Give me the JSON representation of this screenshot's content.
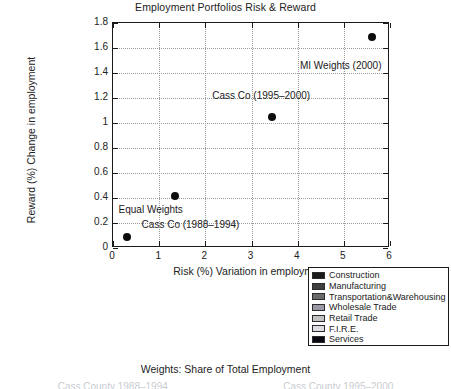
{
  "chart_data": {
    "type": "scatter",
    "title": "Employment Portfolios Risk & Reward",
    "xlabel": "Risk (%) Variation in employment",
    "ylabel": "Reward (%) Change in employment",
    "xlim": [
      0,
      6
    ],
    "ylim": [
      0,
      1.8
    ],
    "xticks": [
      "0",
      "1",
      "2",
      "3",
      "4",
      "5",
      "6"
    ],
    "yticks": [
      "0",
      "0.2",
      "0.4",
      "0.6",
      "0.8",
      "1",
      "1.2",
      "1.4",
      "1.6",
      "1.8"
    ],
    "grid": true,
    "legend_position": "below-right",
    "marker": "filled-circle",
    "marker_color": "#0d0d0d",
    "points": [
      {
        "label": "Equal Weights",
        "x": 0.3,
        "y": 0.09
      },
      {
        "label": "Cass Co (1988-1994)",
        "x": 1.35,
        "y": 0.42
      },
      {
        "label": "Cass Co (1995-2000)",
        "x": 3.45,
        "y": 1.05
      },
      {
        "label": "MI Weights (2000)",
        "x": 5.6,
        "y": 1.69
      }
    ],
    "annotations": [
      {
        "text": "MI Weights (2000)",
        "x": 4.05,
        "y": 1.46
      },
      {
        "text": "Cass Co (1995–2000)",
        "x": 2.15,
        "y": 1.22
      },
      {
        "text": "Equal Weights",
        "x": 0.12,
        "y": 0.305
      },
      {
        "text": "Cass Co (1988–1994)",
        "x": 0.62,
        "y": 0.185
      }
    ],
    "legend": {
      "entries": [
        {
          "label": "Construction",
          "color": "#1b1b1b"
        },
        {
          "label": "Manufacturing",
          "color": "#3f3f3f"
        },
        {
          "label": "Transportation&Warehousing",
          "color": "#6a6a6a"
        },
        {
          "label": "Wholesale Trade",
          "color": "#9a9aa6"
        },
        {
          "label": "Retail Trade",
          "color": "#c2c2c2"
        },
        {
          "label": "F.I.R.E.",
          "color": "#dcdde2"
        },
        {
          "label": "Services",
          "color": "#0a0a14"
        }
      ]
    }
  },
  "captions": {
    "weights_note": "Weights: Share of Total Employment",
    "cut_left": "Cass County 1988–1994",
    "cut_right": "Cass County 1995–2000"
  }
}
